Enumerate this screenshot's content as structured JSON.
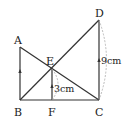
{
  "diagram": {
    "type": "geometry",
    "points": {
      "A": {
        "label": "A",
        "x": 20,
        "y": 47
      },
      "B": {
        "label": "B",
        "x": 20,
        "y": 100
      },
      "C": {
        "label": "C",
        "x": 99,
        "y": 100
      },
      "D": {
        "label": "D",
        "x": 99,
        "y": 20
      },
      "E": {
        "label": "E",
        "x": 52,
        "y": 69
      },
      "F": {
        "label": "F",
        "x": 52,
        "y": 100
      }
    },
    "segments": [
      "AB",
      "BC",
      "CD",
      "AC",
      "BD",
      "EF"
    ],
    "measurements": {
      "EF": "3cm",
      "CD": "9cm"
    },
    "colors": {
      "line": "#333333",
      "dashed": "#aaaaaa",
      "background": "#ffffff"
    }
  }
}
